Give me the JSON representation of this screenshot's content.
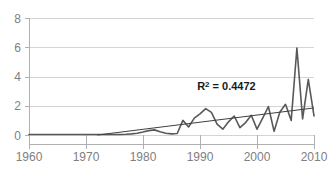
{
  "chart_data": {
    "type": "line",
    "title": "",
    "xlabel": "",
    "ylabel": "",
    "xlim": [
      1960,
      2010
    ],
    "ylim": [
      0,
      8
    ],
    "grid": true,
    "legend_position": "none",
    "x_ticks": [
      "1960",
      "1970",
      "1980",
      "1990",
      "2000",
      "2010"
    ],
    "x_tick_values": [
      1960,
      1970,
      1980,
      1990,
      2000,
      2010
    ],
    "y_ticks": [
      "0",
      "2",
      "4",
      "6",
      "8"
    ],
    "y_tick_values": [
      0,
      2,
      4,
      6,
      8
    ],
    "annotations": [
      {
        "name": "r-squared",
        "text": "R² = 0.4472",
        "base": "R",
        "superscript": "2",
        "rest": " = 0.4472",
        "value": 0.4472,
        "x": 1989.5,
        "y": 3.05,
        "bold": true,
        "color": "#1a1a1a"
      }
    ],
    "series": [
      {
        "name": "data",
        "type": "line",
        "color": "#595959",
        "x": [
          1960,
          1961,
          1962,
          1963,
          1964,
          1965,
          1966,
          1967,
          1968,
          1969,
          1970,
          1971,
          1972,
          1973,
          1974,
          1975,
          1976,
          1977,
          1978,
          1979,
          1980,
          1981,
          1982,
          1983,
          1984,
          1985,
          1986,
          1987,
          1988,
          1989,
          1990,
          1991,
          1992,
          1993,
          1994,
          1995,
          1996,
          1997,
          1998,
          1999,
          2000,
          2001,
          2002,
          2003,
          2004,
          2005,
          2006,
          2007,
          2008,
          2009,
          2010
        ],
        "values": [
          0.03,
          0.03,
          0.03,
          0.03,
          0.03,
          0.03,
          0.03,
          0.03,
          0.03,
          0.03,
          0.03,
          0.03,
          0.03,
          0.03,
          0.03,
          0.03,
          0.03,
          0.05,
          0.08,
          0.12,
          0.2,
          0.3,
          0.35,
          0.22,
          0.12,
          0.08,
          0.1,
          1.0,
          0.55,
          1.15,
          1.45,
          1.8,
          1.55,
          0.75,
          0.4,
          0.9,
          1.3,
          0.5,
          0.85,
          1.35,
          0.4,
          1.15,
          1.95,
          0.25,
          1.55,
          2.1,
          1.0,
          5.95,
          1.1,
          3.8,
          1.3
        ]
      },
      {
        "name": "trendline",
        "type": "line",
        "color": "#404040",
        "x": [
          1972.0,
          2010.0
        ],
        "values": [
          0.0,
          1.85
        ]
      }
    ]
  },
  "plot": {
    "left": 29,
    "right": 314,
    "top": 18,
    "bottom": 135
  }
}
